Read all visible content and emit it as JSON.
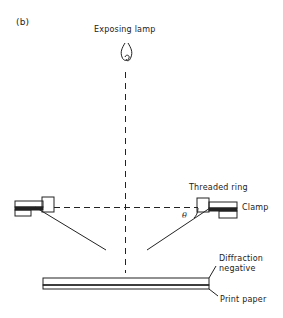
{
  "figure": {
    "panel_label": "(b)",
    "labels": {
      "lamp": "Exposing lamp",
      "threaded_ring": "Threaded ring",
      "clamp": "Clamp",
      "theta": "θ",
      "diffraction_negative_line1": "Diffraction",
      "diffraction_negative_line2": "negative",
      "print_paper": "Print paper"
    },
    "colors": {
      "stroke": "#222222",
      "background": "#ffffff"
    }
  }
}
